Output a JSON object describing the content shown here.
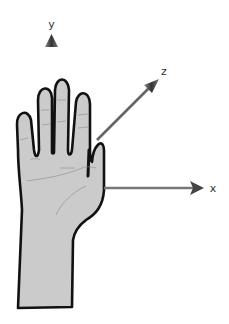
{
  "diagram": {
    "colors": {
      "background": "#ffffff",
      "hand_fill": "#cbcbcb",
      "hand_outline": "#111111",
      "skin_lines": "#8a8a8a",
      "axis": "#6a6a6a",
      "arrow_head": "#555555",
      "label": "#333333"
    },
    "axes": {
      "y": {
        "label": "y",
        "direction": "up"
      },
      "z": {
        "label": "z",
        "direction": "diagonal up-right"
      },
      "x": {
        "label": "x",
        "direction": "right"
      }
    }
  }
}
